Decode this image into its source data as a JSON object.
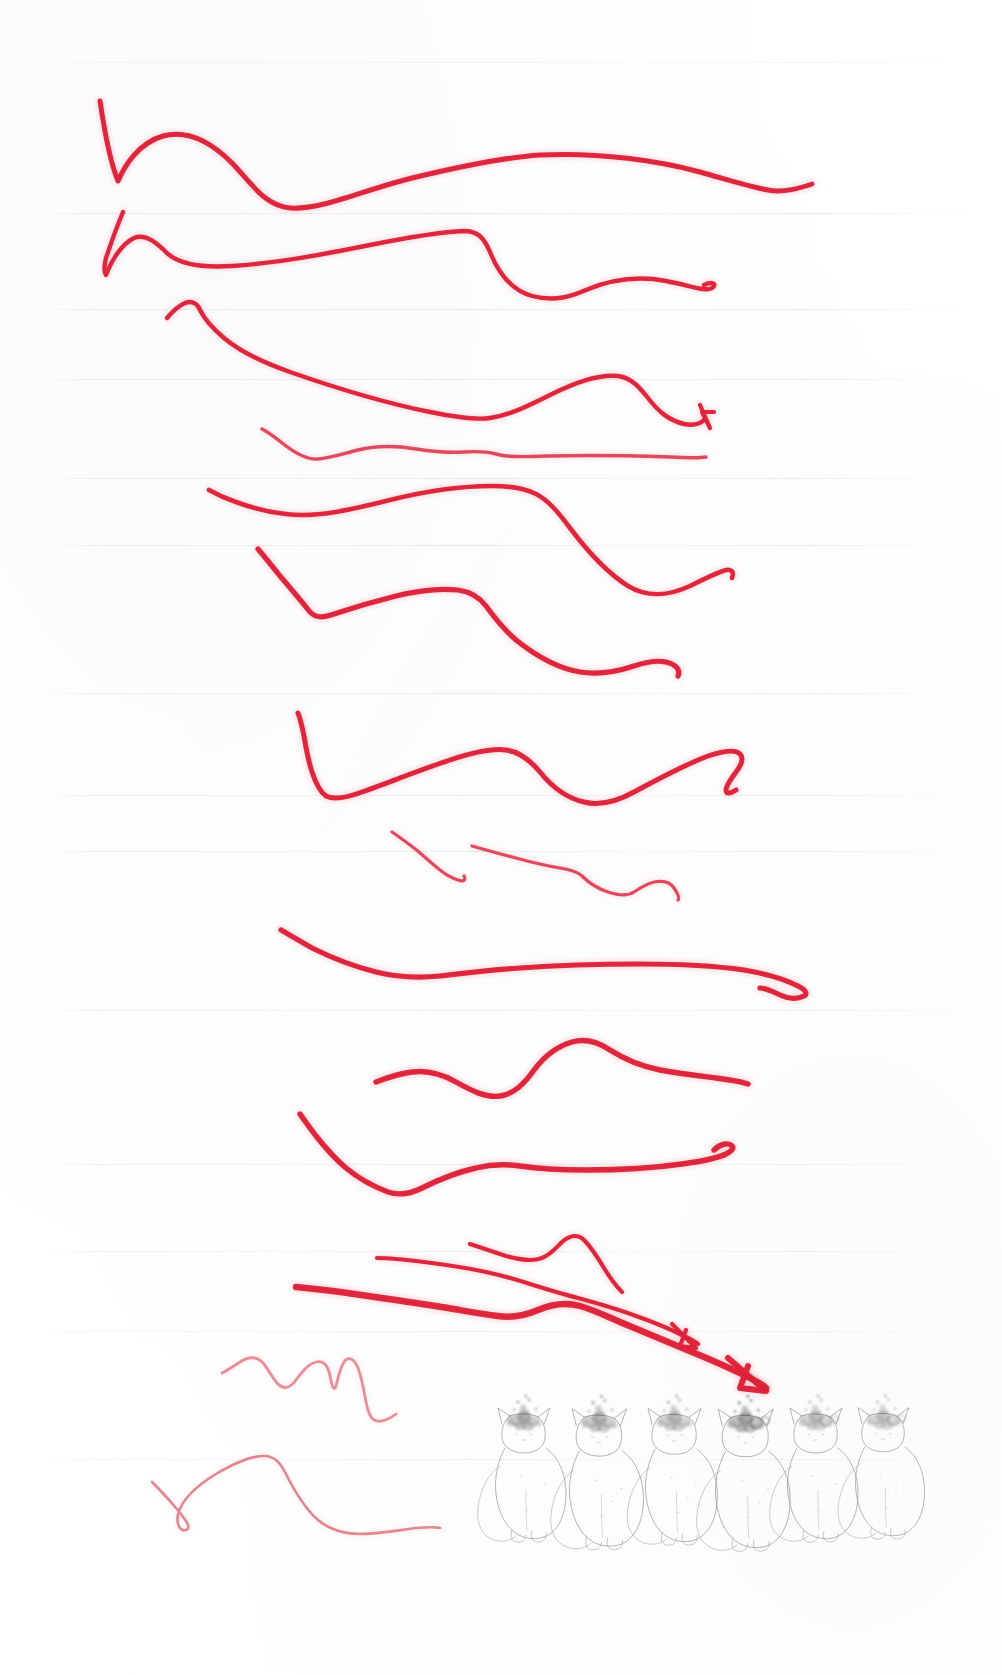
{
  "page": {
    "title": "Scanned notebook page with red ink strokes and pencil cat sketches",
    "width": 1002,
    "height": 1675,
    "background_color": "#ffffff",
    "medium": "scan"
  },
  "colors": {
    "ink_red_dark": "#d81b33",
    "ink_red": "#e8253c",
    "ink_red_light": "#e8636f",
    "ink_pink_faint": "#e9939c",
    "rule_line": "#cdcdd7",
    "pencil_grey": "#9a9a9e",
    "pencil_dark": "#5c5c60",
    "smudge_grey": "#7d7d80"
  },
  "rule_lines": {
    "label": "faint horizontal ruled guide lines",
    "count": 12,
    "y_positions": [
      62,
      213,
      309,
      379,
      478,
      545,
      693,
      795,
      851,
      1010,
      1164,
      1251,
      1331,
      1459
    ]
  },
  "ink_strokes": {
    "label": "red felt-tip pen practice strokes",
    "count": 15,
    "items": [
      {
        "id": "stroke-1",
        "kind": "wave",
        "has_arrowhead": false,
        "weight": 5.0,
        "color": "#dd2038",
        "d": "M100,101 C104,128 110,162 118,181 C124,167 138,143 163,136 C190,129 215,146 232,163 C252,184 265,206 290,208 C322,210 360,191 412,178 C470,164 510,157 540,155 C600,152 660,161 700,172 C735,182 750,187 768,190 C784,193 800,188 812,184"
      },
      {
        "id": "stroke-2",
        "kind": "wave",
        "has_arrowhead": false,
        "weight": 4.4,
        "color": "#dd2038",
        "d": "M123,212 C118,224 112,240 106,258 C104,266 104,272 106,275 C112,259 122,244 134,238 C146,233 158,244 168,254 C180,264 200,268 232,266 C280,263 330,253 370,245 C410,237 440,232 464,231 C478,231 484,238 490,252 C498,272 510,290 532,296 C556,302 572,296 586,290 C612,279 640,276 666,281 C692,286 706,292 712,288 C718,284 712,281 704,285"
      },
      {
        "id": "stroke-3",
        "kind": "wave",
        "has_arrowhead": false,
        "weight": 4.4,
        "color": "#dd2038",
        "d": "M167,318 C172,312 178,306 185,303 C192,300 198,304 200,310 C204,318 212,328 224,338 C238,350 256,360 290,372 C330,386 380,402 430,412 C460,418 478,420 490,418 C510,415 528,406 552,394 C578,381 600,374 618,376 C632,378 640,388 648,398 C658,411 668,420 684,424 C694,426 700,424 704,420"
      },
      {
        "id": "stroke-3b",
        "kind": "arrowhead",
        "has_arrowhead": true,
        "weight": 4.2,
        "color": "#dd2038",
        "d": "M700,405 L710,428 L702,412 L714,412"
      },
      {
        "id": "stroke-4",
        "kind": "wave",
        "has_arrowhead": false,
        "weight": 3.4,
        "color": "#e0455a",
        "d": "M262,429 C268,432 276,438 286,446 C298,455 308,460 318,459 C330,458 342,454 358,450 C378,445 398,446 416,449 C436,452 450,453 464,452 C478,451 488,452 496,454 C506,457 520,457 548,456 C590,455 640,456 670,457 C690,458 700,458 706,457"
      },
      {
        "id": "stroke-5",
        "kind": "wave",
        "has_arrowhead": false,
        "weight": 4.6,
        "color": "#dd2038",
        "d": "M209,490 C216,494 224,498 236,502 C252,508 268,512 286,514 C316,518 350,510 390,500 C430,490 464,486 492,486 C512,486 526,489 536,494 C548,500 558,512 570,528 C588,552 606,572 628,586 C648,598 668,596 690,586 C706,578 718,572 726,570 C732,569 734,572 732,578"
      },
      {
        "id": "stroke-6",
        "kind": "wave",
        "has_arrowhead": false,
        "weight": 5.2,
        "color": "#dd2038",
        "d": "M258,549 C264,556 272,566 280,576 C292,590 302,602 310,612 C316,618 322,618 334,614 C352,608 372,602 396,596 C420,590 440,588 458,590 C472,592 480,598 486,606 C494,617 502,628 516,640 C536,656 556,668 580,672 C600,675 616,672 634,666 C652,660 664,660 672,664 C678,667 680,671 678,676"
      },
      {
        "id": "stroke-7",
        "kind": "wave",
        "has_arrowhead": false,
        "weight": 5.0,
        "color": "#dd2038",
        "d": "M298,713 C300,718 302,726 304,736 C306,748 308,760 312,772 C316,784 320,792 326,796 C334,800 346,798 362,792 C390,782 420,770 450,760 C474,752 492,748 506,750 C520,752 530,760 540,772 C552,787 566,798 584,802 C600,806 616,802 634,792 C660,778 686,764 708,756 C726,750 736,750 740,754 C744,758 742,764 736,772 C730,780 726,786 726,790 C726,794 730,794 736,790"
      },
      {
        "id": "stroke-8",
        "kind": "wave",
        "has_arrowhead": false,
        "weight": 3.2,
        "color": "#e0455a",
        "d": "M392,832 C398,836 406,842 414,848 C424,856 432,864 440,870 C446,875 452,878 458,880 C464,882 466,880 464,876 M472,846 C486,850 500,854 516,858 C534,863 548,866 560,868 C572,870 578,872 582,876 C588,882 596,888 608,892 C620,896 628,896 634,892 C640,888 646,884 654,882 C664,880 670,882 674,888 C678,894 680,898 678,900"
      },
      {
        "id": "stroke-9",
        "kind": "wave",
        "has_arrowhead": false,
        "weight": 5.2,
        "color": "#dd2038",
        "d": "M281,930 C288,934 298,940 312,948 C332,958 352,966 376,972 C400,978 420,978 440,976 C466,973 490,970 520,968 C560,965 600,964 640,964 C680,964 716,966 744,970 C768,974 786,980 798,986 C806,990 808,994 804,996 C796,1000 786,998 778,994 C770,990 764,988 760,988"
      },
      {
        "id": "stroke-10",
        "kind": "wave",
        "has_arrowhead": false,
        "weight": 5.4,
        "color": "#dd2038",
        "d": "M376,1082 C386,1078 398,1074 412,1072 C428,1070 442,1074 456,1082 C472,1091 486,1098 500,1096 C514,1094 524,1084 534,1070 C546,1054 558,1046 572,1042 C586,1038 598,1042 610,1050 C624,1059 640,1066 660,1070 C682,1074 700,1076 716,1078 C732,1080 742,1082 748,1084"
      },
      {
        "id": "stroke-11",
        "kind": "wave",
        "has_arrowhead": false,
        "weight": 5.4,
        "color": "#dd2038",
        "d": "M300,1114 C304,1120 310,1128 316,1136 C324,1146 334,1158 346,1168 C358,1178 372,1186 388,1192 C400,1196 410,1194 422,1188 C440,1179 458,1172 476,1168 C492,1164 506,1164 520,1166 C540,1169 560,1170 586,1170 C620,1170 654,1168 682,1164 C704,1161 718,1158 726,1154 C732,1151 734,1148 732,1146 C728,1142 720,1144 714,1150"
      },
      {
        "id": "stroke-12",
        "kind": "arrow",
        "has_arrowhead": true,
        "weight": 4.2,
        "color": "#dd2038",
        "d": "M377,1258 C392,1258 408,1260 424,1262 C448,1265 468,1268 486,1272 C504,1276 518,1280 530,1284 C546,1289 562,1294 578,1298 C600,1304 620,1310 636,1316 C656,1323 672,1330 684,1336 C692,1340 696,1342 698,1344"
      },
      {
        "id": "stroke-12b",
        "kind": "arrowhead",
        "has_arrowhead": true,
        "weight": 4.2,
        "color": "#dd2038",
        "d": "M672,1324 L696,1348 L680,1346 L686,1330"
      },
      {
        "id": "stroke-13",
        "kind": "wave",
        "has_arrowhead": false,
        "weight": 4.2,
        "color": "#dd2038",
        "d": "M470,1244 C482,1248 494,1252 506,1256 C520,1260 532,1262 542,1258 C550,1255 556,1248 562,1242 C570,1235 578,1234 584,1240 C592,1248 598,1258 604,1268 C610,1278 616,1286 622,1292"
      },
      {
        "id": "stroke-14",
        "kind": "arrow",
        "has_arrowhead": true,
        "weight": 6.4,
        "color": "#dd2038",
        "d": "M296,1287 C318,1289 342,1292 368,1296 C396,1300 424,1304 448,1308 C466,1311 482,1314 498,1316 C512,1318 524,1316 538,1310 C552,1304 566,1302 580,1306 C594,1310 606,1316 620,1322 C644,1332 668,1342 692,1352 C714,1361 734,1370 750,1378 C760,1383 764,1386 766,1388"
      },
      {
        "id": "stroke-14b",
        "kind": "arrowhead",
        "has_arrowhead": true,
        "weight": 6.0,
        "color": "#dd2038",
        "d": "M728,1358 L766,1391 L740,1388 L748,1366"
      },
      {
        "id": "stroke-15",
        "kind": "squiggle",
        "has_arrowhead": false,
        "weight": 2.8,
        "color": "#e88b96",
        "d": "M222,1373 C228,1370 234,1366 240,1362 C248,1357 256,1356 262,1362 C268,1368 272,1378 278,1384 C284,1390 290,1388 296,1380 C302,1372 308,1364 316,1362 C324,1360 328,1366 330,1376 C332,1386 334,1392 336,1386 C338,1378 340,1368 344,1362 C348,1356 354,1358 358,1368 C362,1378 364,1392 366,1402 C368,1412 370,1418 374,1420 C380,1423 388,1420 396,1414"
      },
      {
        "id": "stroke-16",
        "kind": "curve",
        "has_arrowhead": false,
        "weight": 2.6,
        "color": "#e1848e",
        "d": "M152,1482 C158,1488 166,1496 176,1508 C186,1520 192,1528 186,1530 C180,1532 176,1524 178,1514 C182,1500 196,1486 216,1474 C236,1462 252,1456 264,1456 C274,1456 280,1462 286,1474 C294,1490 304,1508 318,1520 C330,1530 344,1534 360,1534 C380,1534 400,1530 416,1528 C428,1527 436,1527 440,1528"
      }
    ]
  },
  "pencil_sketches": {
    "label": "row of six lightly drawn sitting cats with smudged heads",
    "count": 6,
    "cats": [
      {
        "id": "cat-1",
        "x": 496,
        "scale": 1.0,
        "smudge_strength": 0.72,
        "tail_side": "left"
      },
      {
        "id": "cat-2",
        "x": 570,
        "scale": 1.05,
        "smudge_strength": 0.68,
        "tail_side": "left"
      },
      {
        "id": "cat-3",
        "x": 646,
        "scale": 1.02,
        "smudge_strength": 0.62,
        "tail_side": "left"
      },
      {
        "id": "cat-4",
        "x": 716,
        "scale": 1.06,
        "smudge_strength": 0.85,
        "tail_side": "left"
      },
      {
        "id": "cat-5",
        "x": 788,
        "scale": 1.0,
        "smudge_strength": 0.55,
        "tail_side": "left"
      },
      {
        "id": "cat-6",
        "x": 856,
        "scale": 0.98,
        "smudge_strength": 0.5,
        "tail_side": "left"
      }
    ]
  }
}
